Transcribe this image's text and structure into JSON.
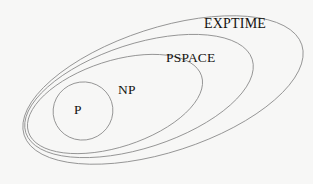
{
  "diagram": {
    "type": "euler-diagram",
    "background_color": "#f7f7f6",
    "stroke_color": "#8a8a8a",
    "text_color": "#14120f",
    "regions": [
      {
        "id": "exptime",
        "label": "EXPTIME",
        "order": 4,
        "shape": "ellipse",
        "cx": 163,
        "cy": 90,
        "rx": 146,
        "ry": 62,
        "rotation": -18
      },
      {
        "id": "pspace",
        "label": "PSPACE",
        "order": 3,
        "shape": "ellipse",
        "cx": 139,
        "cy": 96,
        "rx": 119,
        "ry": 52,
        "rotation": -18
      },
      {
        "id": "np",
        "label": "NP",
        "order": 2,
        "shape": "ellipse",
        "cx": 115,
        "cy": 104,
        "rx": 91,
        "ry": 43,
        "rotation": -18
      },
      {
        "id": "p",
        "label": "P",
        "order": 1,
        "shape": "ellipse",
        "cx": 83,
        "cy": 111,
        "rx": 30,
        "ry": 29,
        "rotation": -18
      }
    ],
    "containment": "P ⊆ NP ⊆ PSPACE ⊆ EXPTIME"
  }
}
